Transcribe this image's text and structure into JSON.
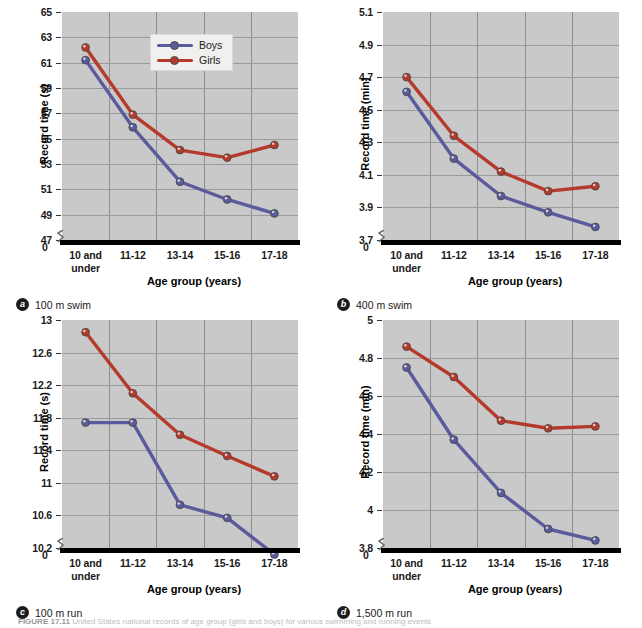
{
  "figure": {
    "caption_label": "FIGURE 17.11",
    "caption_text": "United States national records of age group (girls and boys) for various swimming and running events"
  },
  "legend": {
    "entries": [
      {
        "label": "Boys",
        "color": "#5a5a9c"
      },
      {
        "label": "Girls",
        "color": "#b63a2c"
      }
    ]
  },
  "colors": {
    "boys": "#5a5a9c",
    "girls": "#b63a2c",
    "plot_background": "#c9c9c9",
    "gridline": "#8d8d8d",
    "axis": "#000000"
  },
  "axis_common": {
    "xlabel": "Age group (years)",
    "categories": [
      "10 and under",
      "11-12",
      "13-14",
      "15-16",
      "17-18"
    ],
    "category_lines": [
      [
        "10 and",
        "under"
      ],
      [
        "11-12"
      ],
      [
        "13-14"
      ],
      [
        "15-16"
      ],
      [
        "17-18"
      ]
    ],
    "zero_label": "0"
  },
  "panels": [
    {
      "badge": "a",
      "title": "100 m swim",
      "ylabel": "Record time (s)",
      "yticks": [
        "65",
        "63",
        "61",
        "59",
        "57",
        "55",
        "53",
        "51",
        "49",
        "47"
      ],
      "has_legend": true
    },
    {
      "badge": "b",
      "title": "400 m swim",
      "ylabel": "Record time (min)",
      "yticks": [
        "5.1",
        "4.9",
        "4.7",
        "4.5",
        "4.3",
        "4.1",
        "3.9",
        "3.7"
      ],
      "has_legend": false
    },
    {
      "badge": "c",
      "title": "100 m run",
      "ylabel": "Record time (s)",
      "yticks": [
        "13.0",
        "12.6",
        "12.2",
        "11.8",
        "11.4",
        "11.0",
        "10.6",
        "10.2"
      ],
      "has_legend": false
    },
    {
      "badge": "d",
      "title": "1,500 m run",
      "ylabel": "Record time (min)",
      "yticks": [
        "5.0",
        "4.8",
        "4.6",
        "4.4",
        "4.2",
        "4.0",
        "3.8"
      ],
      "has_legend": false
    }
  ],
  "chart_data": [
    {
      "type": "line",
      "panel": "a",
      "title": "100 m swim",
      "xlabel": "Age group (years)",
      "ylabel": "Record time (s)",
      "categories": [
        "10 and under",
        "11-12",
        "13-14",
        "15-16",
        "17-18"
      ],
      "ylim": [
        47,
        65
      ],
      "yticks": [
        65,
        63,
        61,
        59,
        57,
        55,
        53,
        51,
        49,
        47
      ],
      "axis_break": true,
      "grid": true,
      "legend_position": "upper-center",
      "series": [
        {
          "name": "Boys",
          "color": "#5a5a9c",
          "values": [
            61.2,
            55.9,
            51.6,
            50.2,
            49.1
          ]
        },
        {
          "name": "Girls",
          "color": "#b63a2c",
          "values": [
            62.2,
            56.9,
            54.1,
            53.5,
            54.5
          ]
        }
      ]
    },
    {
      "type": "line",
      "panel": "b",
      "title": "400 m swim",
      "xlabel": "Age group (years)",
      "ylabel": "Record time (min)",
      "categories": [
        "10 and under",
        "11-12",
        "13-14",
        "15-16",
        "17-18"
      ],
      "ylim": [
        3.7,
        5.1
      ],
      "yticks": [
        5.1,
        4.9,
        4.7,
        4.5,
        4.3,
        4.1,
        3.9,
        3.7
      ],
      "axis_break": true,
      "grid": true,
      "legend_position": "none",
      "series": [
        {
          "name": "Boys",
          "color": "#5a5a9c",
          "values": [
            4.61,
            4.2,
            3.97,
            3.87,
            3.78
          ]
        },
        {
          "name": "Girls",
          "color": "#b63a2c",
          "values": [
            4.7,
            4.34,
            4.12,
            4.0,
            4.03
          ]
        }
      ]
    },
    {
      "type": "line",
      "panel": "c",
      "title": "100 m run",
      "xlabel": "Age group (years)",
      "ylabel": "Record time (s)",
      "categories": [
        "10 and under",
        "11-12",
        "13-14",
        "15-16",
        "17-18"
      ],
      "ylim": [
        10.2,
        13.0
      ],
      "yticks": [
        13.0,
        12.6,
        12.2,
        11.8,
        11.4,
        11.0,
        10.6,
        10.2
      ],
      "axis_break": true,
      "grid": true,
      "legend_position": "none",
      "series": [
        {
          "name": "Boys",
          "color": "#5a5a9c",
          "values": [
            11.74,
            11.74,
            10.73,
            10.57,
            10.12
          ]
        },
        {
          "name": "Girls",
          "color": "#b63a2c",
          "values": [
            12.85,
            12.1,
            11.59,
            11.33,
            11.08
          ]
        }
      ]
    },
    {
      "type": "line",
      "panel": "d",
      "title": "1,500 m run",
      "xlabel": "Age group (years)",
      "ylabel": "Record time (min)",
      "categories": [
        "10 and under",
        "11-12",
        "13-14",
        "15-16",
        "17-18"
      ],
      "ylim": [
        3.8,
        5.0
      ],
      "yticks": [
        5.0,
        4.8,
        4.6,
        4.4,
        4.2,
        4.0,
        3.8
      ],
      "axis_break": true,
      "grid": true,
      "legend_position": "none",
      "series": [
        {
          "name": "Boys",
          "color": "#5a5a9c",
          "values": [
            4.75,
            4.37,
            4.09,
            3.9,
            3.84
          ]
        },
        {
          "name": "Girls",
          "color": "#b63a2c",
          "values": [
            4.86,
            4.7,
            4.47,
            4.43,
            4.44
          ]
        }
      ]
    }
  ]
}
